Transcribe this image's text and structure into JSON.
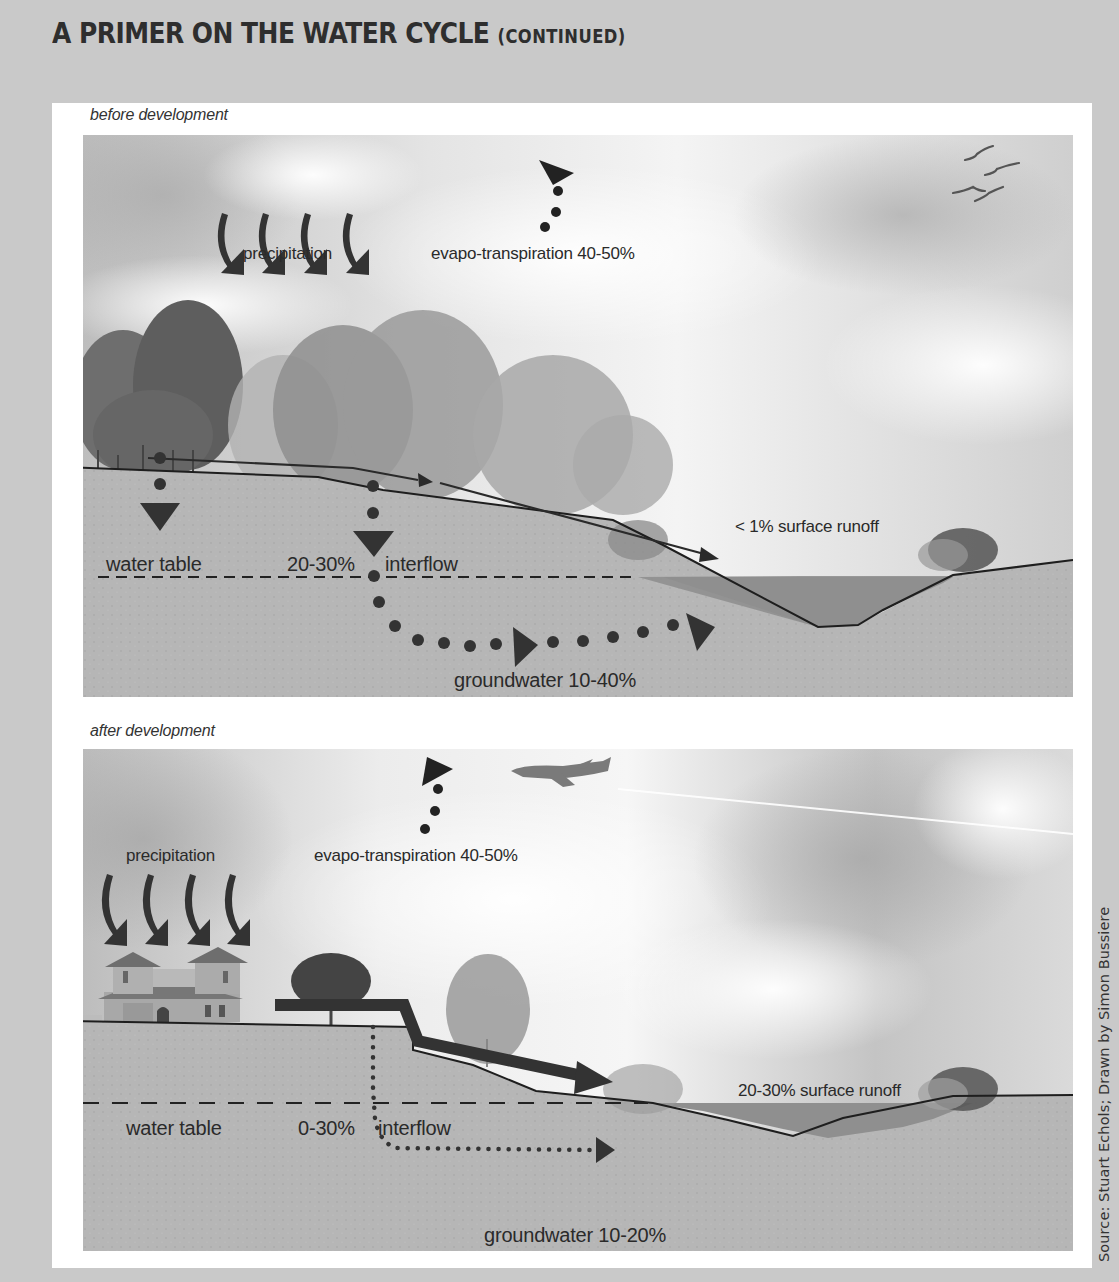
{
  "page": {
    "title": "A PRIMER ON THE WATER CYCLE",
    "title_suffix": "(CONTINUED)",
    "credit": "Source: Stuart Echols; Drawn by Simon Bussiere"
  },
  "colors": {
    "page_background": "#c9c9c9",
    "sheet": "#ffffff",
    "arrow": "#333333",
    "soil": "#b4b4b4",
    "water": "#8f8f8f",
    "sky": "#d9d9d9"
  },
  "panels": [
    {
      "id": "before",
      "label": "before development",
      "icons": [
        "cloud-icon",
        "tree-icon",
        "bird-icon",
        "shrub-icon"
      ],
      "labels": {
        "precipitation": "precipitation",
        "evapotranspiration": "evapo-transpiration 40-50%",
        "surface_runoff": "< 1% surface runoff",
        "water_table": "water table",
        "interflow_pct": "20-30%",
        "interflow": "interflow",
        "groundwater": "groundwater 10-40%"
      },
      "flows": {
        "evapotranspiration_pct": "40-50%",
        "surface_runoff_pct": "< 1%",
        "interflow_pct": "20-30%",
        "groundwater_pct": "10-40%"
      }
    },
    {
      "id": "after",
      "label": "after development",
      "icons": [
        "cloud-icon",
        "house-icon",
        "tree-icon",
        "airplane-icon",
        "shrub-icon"
      ],
      "labels": {
        "precipitation": "precipitation",
        "evapotranspiration": "evapo-transpiration 40-50%",
        "surface_runoff": "20-30% surface runoff",
        "water_table": "water table",
        "interflow_pct": "0-30%",
        "interflow": "interflow",
        "groundwater": "groundwater 10-20%"
      },
      "flows": {
        "evapotranspiration_pct": "40-50%",
        "surface_runoff_pct": "20-30%",
        "interflow_pct": "0-30%",
        "groundwater_pct": "10-20%"
      }
    }
  ]
}
